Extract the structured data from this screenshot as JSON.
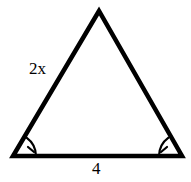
{
  "figure": {
    "background_color": "#ffffff",
    "stroke_color": "#000000",
    "stroke_width": 4.5,
    "canvas": {
      "width": 191,
      "height": 182
    }
  },
  "triangle": {
    "shape": "isosceles-triangle",
    "vertices": {
      "apex": {
        "x": 99,
        "y": 11
      },
      "bottom_left": {
        "x": 13,
        "y": 156
      },
      "bottom_right": {
        "x": 182,
        "y": 156
      }
    },
    "path": "M 99 11 L 13 156 L 182 156 Z"
  },
  "labels": {
    "left_side": "2x",
    "base": "4"
  },
  "angle_marks": [
    {
      "name": "bottom-left-angle-mark",
      "vertex": {
        "x": 13,
        "y": 156
      },
      "arc_path": "M 36 156 A 23 23 0 0 0 26.5 137.6",
      "tick_path": "M 28.0 147.0 L 34.0 152.0",
      "congruence_ticks": 1
    },
    {
      "name": "bottom-right-angle-mark",
      "vertex": {
        "x": 182,
        "y": 156
      },
      "arc_path": "M 159 156 A 23 23 0 0 1 168.5 137.6",
      "tick_path": "M 167.0 147.0 L 161.0 152.0",
      "congruence_ticks": 1
    }
  ]
}
